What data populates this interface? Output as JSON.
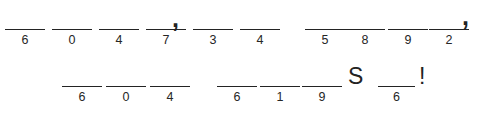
{
  "puzzle": {
    "type": "cryptogram-answer-blanks",
    "ink_color": "#232323",
    "background_color": "#ffffff",
    "rows": [
      {
        "name": "row-1",
        "groups": [
          {
            "name": "word-1",
            "blanks": [
              {
                "code": "6",
                "x": 5,
                "y": 29,
                "w": 40
              },
              {
                "code": "0",
                "x": 52,
                "y": 29,
                "w": 40
              },
              {
                "code": "4",
                "x": 99,
                "y": 29,
                "w": 40
              },
              {
                "code": "7",
                "x": 146,
                "y": 29,
                "w": 40
              }
            ]
          },
          {
            "name": "word-2",
            "blanks": [
              {
                "code": "3",
                "x": 193,
                "y": 29,
                "w": 40
              },
              {
                "code": "4",
                "x": 240,
                "y": 29,
                "w": 40
              }
            ]
          },
          {
            "name": "word-3",
            "blanks": [
              {
                "code": "5",
                "x": 305,
                "y": 29,
                "w": 40
              },
              {
                "code": "8",
                "x": 345,
                "y": 29,
                "w": 40
              },
              {
                "code": "9",
                "x": 388,
                "y": 29,
                "w": 40
              },
              {
                "code": "2",
                "x": 429,
                "y": 29,
                "w": 40
              }
            ]
          }
        ],
        "glyphs": [
          {
            "name": "comma-1",
            "char": ",",
            "x": 172,
            "y": 6,
            "kind": "comma"
          },
          {
            "name": "comma-2",
            "char": ",",
            "x": 462,
            "y": 4,
            "kind": "comma"
          }
        ]
      },
      {
        "name": "row-2",
        "groups": [
          {
            "name": "word-4",
            "blanks": [
              {
                "code": "6",
                "x": 62,
                "y": 86,
                "w": 40
              },
              {
                "code": "0",
                "x": 106,
                "y": 86,
                "w": 40
              },
              {
                "code": "4",
                "x": 150,
                "y": 86,
                "w": 40
              }
            ]
          },
          {
            "name": "word-5",
            "blanks": [
              {
                "code": "6",
                "x": 217,
                "y": 86,
                "w": 40
              },
              {
                "code": "1",
                "x": 260,
                "y": 86,
                "w": 40
              },
              {
                "code": "9",
                "x": 302,
                "y": 86,
                "w": 40
              }
            ]
          },
          {
            "name": "word-6",
            "blanks": [
              {
                "code": "6",
                "x": 378,
                "y": 86,
                "w": 37
              }
            ]
          }
        ],
        "glyphs": [
          {
            "name": "letter-s",
            "char": "S",
            "x": 348,
            "y": 65,
            "kind": "letter"
          },
          {
            "name": "exclamation",
            "char": "!",
            "x": 419,
            "y": 65,
            "kind": "bang"
          }
        ]
      }
    ]
  }
}
